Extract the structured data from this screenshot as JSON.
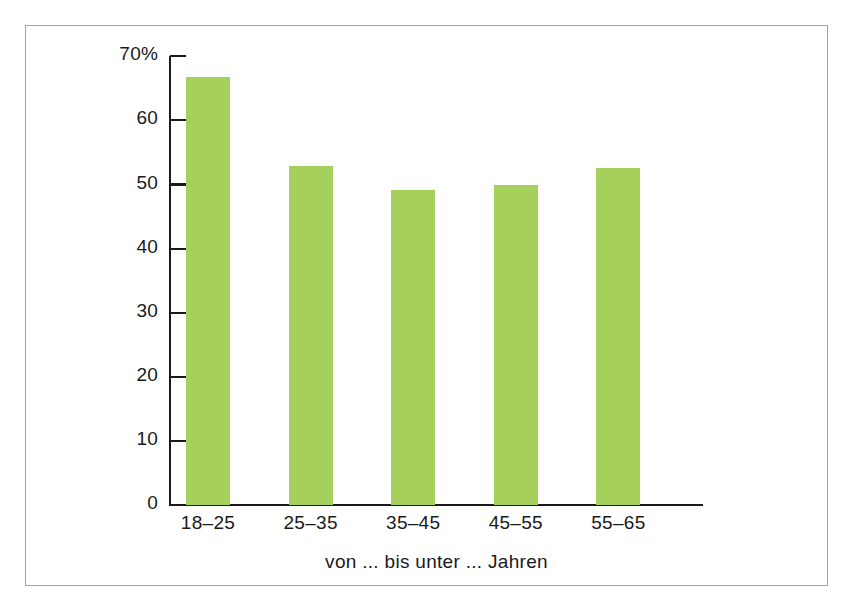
{
  "chart_data": {
    "type": "bar",
    "title": "",
    "subtitle": "",
    "categories": [
      "18–25",
      "25–35",
      "35–45",
      "45–55",
      "55–65"
    ],
    "values": [
      66.7,
      52.9,
      49.1,
      49.9,
      52.6
    ],
    "xlabel": "von ... bis unter ... Jahren",
    "ylabel": "",
    "ylim": [
      0,
      70
    ],
    "yticks": [
      0,
      10,
      20,
      30,
      40,
      50,
      60,
      70
    ],
    "ytick_labels": [
      "0",
      "10",
      "20",
      "30",
      "40",
      "50",
      "60",
      "70%"
    ],
    "grid": false,
    "legend": null,
    "bar_color": "#a6d05c",
    "axis_color": "#1a1a1a",
    "frame_color": "#8fbf4f",
    "background": "#ffffff",
    "unit": "%"
  },
  "figure": {
    "frame_label": "chart-frame",
    "background_label": "figure-background"
  }
}
